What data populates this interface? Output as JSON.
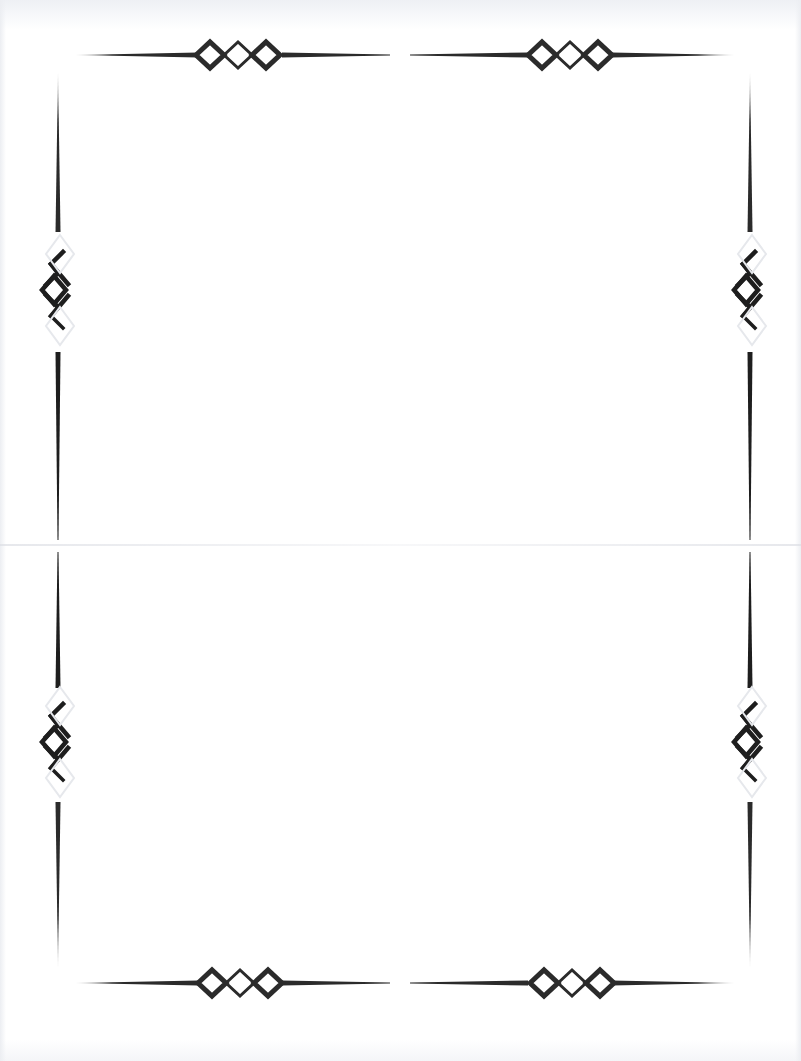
{
  "document": {
    "type": "decorative page border",
    "text": "",
    "colors": {
      "ornament": "#2b2b2b",
      "paper": "#ffffff",
      "scan_edge": "#eef0f4"
    },
    "ornaments": {
      "top": [
        "triple-diamond-left",
        "triple-diamond-right"
      ],
      "bottom": [
        "triple-diamond-left",
        "triple-diamond-right"
      ],
      "left": [
        "chain-diamond-upper",
        "chain-diamond-lower"
      ],
      "right": [
        "chain-diamond-upper",
        "chain-diamond-lower"
      ]
    }
  }
}
